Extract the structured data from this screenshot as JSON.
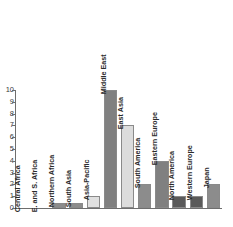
{
  "chart_data": {
    "type": "bar",
    "title": "",
    "xlabel": "",
    "ylabel": "",
    "ylim": [
      0,
      10
    ],
    "grid": false,
    "legend": "none",
    "orientation": "vertical",
    "ytick_labels": [
      "10",
      "9",
      "8",
      "7",
      "6",
      "5",
      "4",
      "3",
      "2",
      "1",
      "0"
    ],
    "ytick_values": [
      10,
      9,
      8,
      7,
      6,
      5,
      4,
      3,
      2,
      1,
      0
    ],
    "categories": [
      "Central Africa",
      "E. and S. Africa",
      "Northern Africa",
      "South Asia",
      "Asia-Pacific",
      "Middle East",
      "East Asia",
      "South America",
      "Eastern Europe",
      "North America",
      "Western Europe",
      "Japan"
    ],
    "values": [
      0,
      0,
      0.4,
      0.45,
      1,
      10,
      7,
      2,
      4,
      1,
      1,
      2
    ],
    "bar_colors": [
      "#7f7f7f",
      "#7f7f7f",
      "#8c8c8c",
      "#8c8c8c",
      "#e0e0e0",
      "#808080",
      "#dcdcdc",
      "#8c8c8c",
      "#808080",
      "#5a5a5a",
      "#5a5a5a",
      "#8c8c8c"
    ]
  },
  "axis": {
    "line_color": "#6e6e6e",
    "tick_color": "#6e6e6e"
  },
  "style": {
    "background": "#ffffff",
    "label_color": "#2b2b2b",
    "tick_label_color": "#3a3a3a",
    "bar_edge_color": "#8a8a8a"
  }
}
